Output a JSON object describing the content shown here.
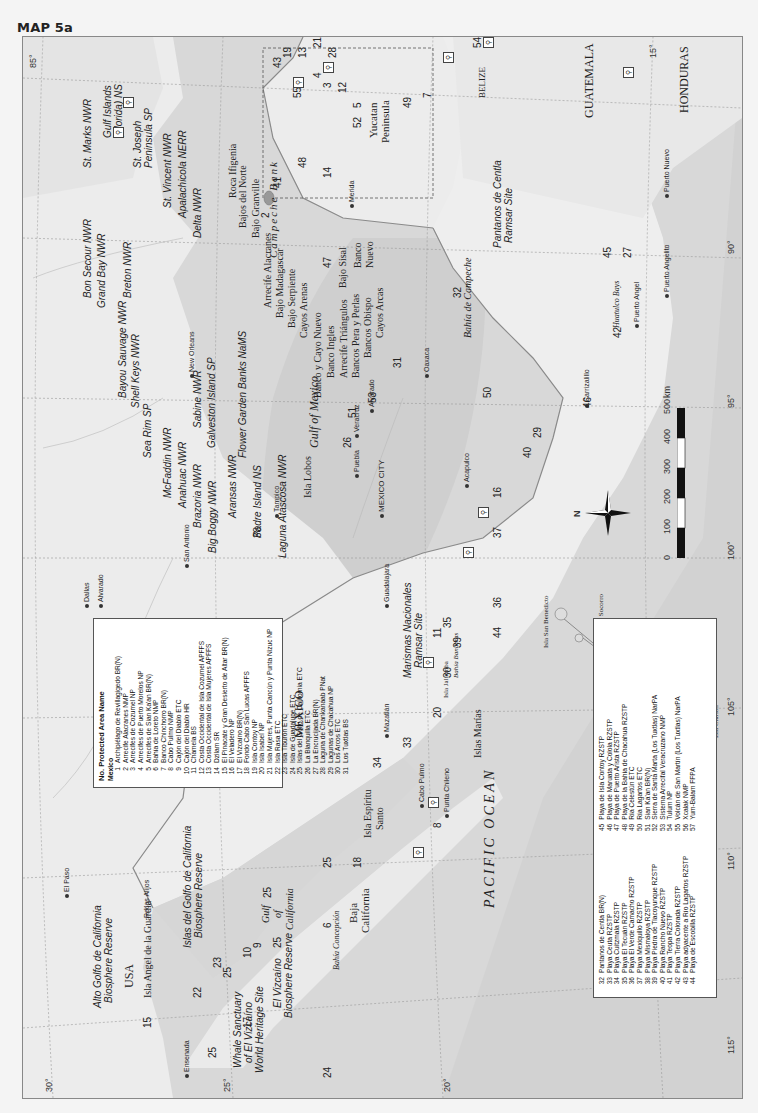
{
  "page": {
    "title": "MAP 5a"
  },
  "map": {
    "graticule": {
      "longitudes": [
        "115°",
        "110°",
        "105°",
        "100°",
        "95°",
        "90°",
        "85°"
      ],
      "latitudes": [
        "30°",
        "25°",
        "20°",
        "15°"
      ]
    },
    "countries": [
      "USA",
      "MEXICO",
      "GUATEMALA",
      "BELIZE",
      "HONDURAS"
    ],
    "water_bodies": {
      "pacific": "PACIFIC OCEAN",
      "gulf": "Gulf of Mexico",
      "gulf_cal_1": "Gulf",
      "gulf_cal_2": "of",
      "gulf_cal_3": "California",
      "campeche_bank": "Campeche Bank",
      "bahia_campeche": "Bahía de Campeche",
      "bahia_concepcion": "Bahía Concepción",
      "bahia_banderas": "Bahía Banderas",
      "huatulco": "Huatulco Bays"
    },
    "regions": {
      "baja1": "Baja",
      "baja2": "California",
      "yucatan1": "Yucatan",
      "yucatan2": "Peninsula"
    },
    "cities": {
      "ensenada": "Ensenada",
      "el_paso": "El Paso",
      "dallas": "Dallas",
      "alvarado_tx": "Alvarado",
      "san_antonio": "San Antonio",
      "new_orleans": "New Orleans",
      "mazatlan": "Mazatlán",
      "guadalajara": "Guadalajara",
      "mexico_city": "MEXICO CITY",
      "puebla": "Puebla",
      "veracruz": "Veracruz",
      "alvarado": "Alvarado",
      "oaxaca": "Oaxaca",
      "acapulco": "Acapulco",
      "tampico": "Tampico",
      "merida": "Merida",
      "puerto_angel": "Puerto Angel",
      "puerto_angelito": "Puerto Angelito",
      "puerto_nuevo": "Puerto Nuevo",
      "cabo_pulmo": "Cabo Pulmo",
      "punta_chileno": "Punta Chileno",
      "carrizalillo": "Carrizalillo"
    },
    "islands": {
      "clarion": "Isla Clarión",
      "roca_partida": "Isla Roca Partida",
      "socorro": "Isla Socorro",
      "san_benedicto": "Isla San Benedicto",
      "revillagigedo": "Islas Revillagigedo",
      "marias": "Islas Marías",
      "jaltemba": "Isla Jaltemba",
      "espiritu1": "Isla Espíritu",
      "espiritu2": "Santo",
      "angel": "Isla Angel de la Guardia",
      "rocas_alijos": "Rocas Alijos",
      "lobos": "Isla Lobos"
    },
    "us_sites": {
      "st_marks": "St. Marks NWR",
      "gulf_islands1": "Gulf Islands",
      "gulf_islands2": "(Florida) NS",
      "st_joseph1": "St. Joseph",
      "st_joseph2": "Peninsula SP",
      "st_vincent": "St. Vincent NWR",
      "apalachicola": "Apalachicola NERR",
      "delta": "Delta NWR",
      "bon_secour": "Bon Secour NWR",
      "grand_bay": "Grand Bay NWR",
      "breton": "Breton NWR",
      "bayou": "Bayou Sauvage NWR",
      "shell_keys": "Shell Keys NWR",
      "sea_rim": "Sea Rim SP",
      "sabine": "Sabine NWR",
      "galveston": "Galveston Island SP",
      "mcfaddin": "McFaddin NWR",
      "anahuac": "Anahuac NWR",
      "brazoria": "Brazoria NWR",
      "big_boggy": "Big Boggy NWR",
      "aransas": "Aransas NWR",
      "padre": "Padre Island NS",
      "laguna_atascosa": "Laguna Atascosa NWR",
      "flower_garden": "Flower Garden Banks NaMS"
    },
    "mx_sites": {
      "alto_golfo1": "Alto Golfo de California",
      "alto_golfo2": "Biosphere Reserve",
      "islas_golfo1": "Islas del Golfo de California",
      "islas_golfo2": "Biosphere Reserve",
      "whale1": "Whale Sanctuary",
      "whale2": "of El Vizcaíno",
      "whale3": "World Heritage Site",
      "vizcaino1": "El Vizcaíno",
      "vizcaino2": "Biosphere Reserve",
      "marismas1": "Marismas Nacionales",
      "marismas2": "Ramsar Site",
      "pantanos1": "Pantanos de Centla",
      "pantanos2": "Ramsar Site"
    },
    "reefs": {
      "bajos_norte": "Bajos del Norte",
      "bajo_granville": "Bajo Granville",
      "roca_ifigenia": "Roca Ifigenia",
      "arrecife_alacranes": "Arrecife Alacranes",
      "bajo_madagascar": "Bajo Madagascar",
      "bajo_serpiente": "Bajo Serpiente",
      "cayos_arenas": "Cayos Arenas",
      "banco_cayo_nuevo": "Banco y Cayo Nuevo",
      "banco_ingles": "Banco Ingles",
      "arrecife_triangulos": "Arrecife Triángulos",
      "bancos_pera": "Bancos Pera y Perlas",
      "bancos_obispo": "Bancos Obispo",
      "cayos_arcas": "Cayos Arcas",
      "bajo_sisal": "Bajo Sisal",
      "banco_nuevo1": "Banco",
      "banco_nuevo2": "Nuevo"
    },
    "scale": {
      "labels": [
        "0",
        "100",
        "200",
        "300",
        "400",
        "500"
      ],
      "unit": "km"
    },
    "compass": {
      "north": "N"
    }
  },
  "legend1": {
    "header": "No. Protected Area Name",
    "subheader": "Mexico",
    "rows": [
      {
        "n": "1",
        "name": "Archipiélago de Revillagigedo BR(N)"
      },
      {
        "n": "2",
        "name": "Arrecife Alacranes NMP"
      },
      {
        "n": "3",
        "name": "Arrecifes de Cozumel NP"
      },
      {
        "n": "4",
        "name": "Arrecifes de Puerto Morelos NP"
      },
      {
        "n": "5",
        "name": "Arrecifes de Sian Ka'an BR(N)"
      },
      {
        "n": "6",
        "name": "Bahía de Loreto NMP"
      },
      {
        "n": "7",
        "name": "Banco Chinchorro BR(N)"
      },
      {
        "n": "8",
        "name": "Cabo Pulmo NMP"
      },
      {
        "n": "9",
        "name": "Cajón del Diablo ETC"
      },
      {
        "n": "10",
        "name": "Cajón del Diablo HR"
      },
      {
        "n": "11",
        "name": "Chamela BS"
      },
      {
        "n": "12",
        "name": "Costa Occidental de Isla Cozumel APFFS"
      },
      {
        "n": "13",
        "name": "Costa Occidental de Isla Mujeres APFFS"
      },
      {
        "n": "14",
        "name": "Dzilam SR"
      },
      {
        "n": "15",
        "name": "El Pinacate y Gran Desierto de Altar BR(N)"
      },
      {
        "n": "16",
        "name": "El Veladero NP"
      },
      {
        "n": "17",
        "name": "El Vizcaíno BR(N)"
      },
      {
        "n": "18",
        "name": "Fondo Cabo San Lucas APFFS"
      },
      {
        "n": "19",
        "name": "Isla Contoy NP"
      },
      {
        "n": "20",
        "name": "Isla Isabel NP"
      },
      {
        "n": "21",
        "name": "Isla Mujeres, Punta Cancún y Punta Nizuc NP"
      },
      {
        "n": "22",
        "name": "Isla Rasa ETC"
      },
      {
        "n": "23",
        "name": "Isla Tiburón ETC"
      },
      {
        "n": "24",
        "name": "Isla de Guadalupe ETC"
      },
      {
        "n": "25",
        "name": "Islas del Golfo de California ETC"
      },
      {
        "n": "26",
        "name": "La Blanquilla ETC"
      },
      {
        "n": "27",
        "name": "La Encrucijada BR(N)"
      },
      {
        "n": "28",
        "name": "Laguna de Chankanaab PNat"
      },
      {
        "n": "29",
        "name": "Lagunas de Chacahua NP"
      },
      {
        "n": "30",
        "name": "Los Arcos ETC"
      },
      {
        "n": "31",
        "name": "Los Tuxtlas BS"
      }
    ]
  },
  "legend2": {
    "col1": [
      {
        "n": "32",
        "name": "Pantanos de Centla BR(N)"
      },
      {
        "n": "33",
        "name": "Playa Ceuta RZSTP"
      },
      {
        "n": "34",
        "name": "Playa Cuitzmala RZSTP"
      },
      {
        "n": "35",
        "name": "Playa El Tecuán RZSTP"
      },
      {
        "n": "36",
        "name": "Playa El Verde Camacho RZSTP"
      },
      {
        "n": "37",
        "name": "Playa Mexiquillo RZSTP"
      },
      {
        "n": "38",
        "name": "Playa Mismaloya RZSTP"
      },
      {
        "n": "39",
        "name": "Playa Piedra de Tlacoyunque RZSTP"
      },
      {
        "n": "40",
        "name": "Playa Rancho Nuevo RZSTP"
      },
      {
        "n": "41",
        "name": "Playa Teopa RZSTP"
      },
      {
        "n": "42",
        "name": "Playa Tierra Colorada RZSTP"
      },
      {
        "n": "43",
        "name": "Playa adyacente a Río Lagartos RZSTP"
      },
      {
        "n": "44",
        "name": "Playa de Escobilla RZSTP"
      }
    ],
    "col2": [
      {
        "n": "45",
        "name": "Playa de Isla Contoy RZSTP"
      },
      {
        "n": "46",
        "name": "Playa de Maruata y Colola RZSTP"
      },
      {
        "n": "47",
        "name": "Playa de Puerto Arista RZSTP"
      },
      {
        "n": "48",
        "name": "Playa de la Bahía de Chacahua RZSTP"
      },
      {
        "n": "49",
        "name": "Ría Celestún ETC"
      },
      {
        "n": "50",
        "name": "Ría Lagartos ETC"
      },
      {
        "n": "51",
        "name": "Sian Ka'an BR(N)"
      },
      {
        "n": "52",
        "name": "Sierra de Santa Marta (Los Tuxtlas) NarPA"
      },
      {
        "n": "53",
        "name": "Sistema Arrecifal Veracruzano NMP"
      },
      {
        "n": "54",
        "name": "Tulum NP"
      },
      {
        "n": "55",
        "name": "Volcán de San Martín (Los Tuxtlas) NarPA"
      },
      {
        "n": "56",
        "name": "Xcalak NMP"
      },
      {
        "n": "57",
        "name": "Yum-Balam FFPA"
      }
    ]
  },
  "site_numbers": [
    "1",
    "2",
    "3",
    "4",
    "5",
    "6",
    "7",
    "8",
    "9",
    "10",
    "11",
    "12",
    "13",
    "14",
    "15",
    "16",
    "17",
    "18",
    "19",
    "20",
    "21",
    "22",
    "23",
    "24",
    "25",
    "25",
    "25",
    "25",
    "25",
    "26",
    "27",
    "28",
    "29",
    "30",
    "31",
    "32",
    "33",
    "34",
    "35",
    "36",
    "37",
    "38",
    "39",
    "40",
    "41",
    "42",
    "43",
    "44",
    "45",
    "46",
    "47",
    "48",
    "49",
    "50",
    "51",
    "52",
    "53",
    "54",
    "55",
    "56",
    "57"
  ]
}
